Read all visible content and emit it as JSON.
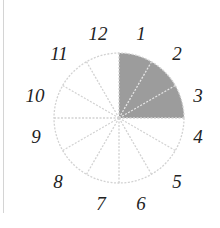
{
  "diagram": {
    "type": "clock-fraction-circle",
    "sectors_total": 12,
    "sectors_shaded": 3,
    "shaded_from": 12,
    "shaded_to": 3,
    "colors": {
      "shade": "#9c9c9c",
      "line": "#d2d2d2",
      "label": "#222222"
    },
    "labels": [
      {
        "text": "12",
        "x": 98,
        "y": 40
      },
      {
        "text": "1",
        "x": 141,
        "y": 40
      },
      {
        "text": "2",
        "x": 177,
        "y": 60
      },
      {
        "text": "3",
        "x": 198,
        "y": 102
      },
      {
        "text": "4",
        "x": 198,
        "y": 143
      },
      {
        "text": "5",
        "x": 177,
        "y": 188
      },
      {
        "text": "6",
        "x": 141,
        "y": 210
      },
      {
        "text": "7",
        "x": 101,
        "y": 210
      },
      {
        "text": "8",
        "x": 58,
        "y": 188
      },
      {
        "text": "9",
        "x": 36,
        "y": 143
      },
      {
        "text": "10",
        "x": 35,
        "y": 102
      },
      {
        "text": "11",
        "x": 59,
        "y": 60
      }
    ]
  }
}
